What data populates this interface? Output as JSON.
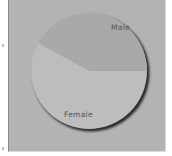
{
  "chart_data": {
    "type": "pie",
    "title": "",
    "categories": [
      "Male",
      "Female"
    ],
    "values": [
      42,
      58
    ],
    "colors": [
      "#a9a9a9",
      "#bdbdbd"
    ],
    "labels_on_slices": true,
    "legend": "none",
    "start_angle_deg": 0,
    "male_slice_span_deg": [
      0,
      152
    ]
  },
  "labels": {
    "male": "Male",
    "female": "Female"
  },
  "colors": {
    "panel_background": "#b3b3b3",
    "shadow": "#2a2a2a"
  }
}
